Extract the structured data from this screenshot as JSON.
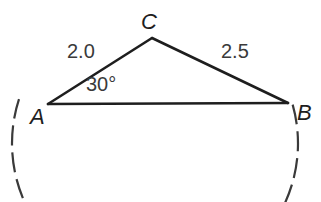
{
  "figure": {
    "type": "geometry-diagram",
    "background_color": "#ffffff",
    "stroke_color": "#1e1e1e",
    "dash_color": "#3a3a3a",
    "labels": {
      "vertex_c": "C",
      "vertex_a": "A",
      "vertex_b": "B",
      "side_ac": "2.0",
      "side_bc": "2.5",
      "angle_a": "30°"
    },
    "geometry": {
      "point_a": {
        "x": 48,
        "y": 104
      },
      "point_b": {
        "x": 288,
        "y": 103
      },
      "point_c": {
        "x": 152,
        "y": 38
      },
      "arc": {
        "center_x": 155,
        "center_y": 55,
        "radius": 143,
        "start_deg": 162,
        "end_deg": 18,
        "dash": "20 7"
      }
    }
  }
}
